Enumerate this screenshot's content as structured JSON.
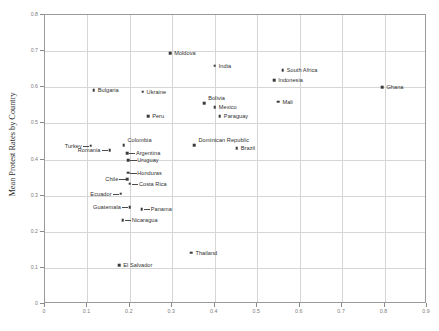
{
  "chart_data": {
    "type": "scatter",
    "title": "",
    "xlabel": "",
    "ylabel": "Mean Protest Rates by Country",
    "xlim": [
      0,
      0.9
    ],
    "ylim": [
      0,
      0.8
    ],
    "xticks": [
      "0",
      "0.1",
      "0.2",
      "0.3",
      "0.4",
      "0.5",
      "0.6",
      "0.7",
      "0.8",
      "0.9"
    ],
    "xtickvals": [
      0,
      0.1,
      0.2,
      0.3,
      0.4,
      0.5,
      0.6,
      0.7,
      0.8,
      0.9
    ],
    "yticks": [
      "0",
      "0.1",
      "0.2",
      "0.3",
      "0.4",
      "0.5",
      "0.6",
      "0.7",
      "0.8"
    ],
    "ytickvals": [
      0,
      0.1,
      0.2,
      0.3,
      0.4,
      0.5,
      0.6,
      0.7,
      0.8
    ],
    "grid": true,
    "legend": "none",
    "marker_color": "#3a3a3a",
    "grid_color": "#d6d6d6",
    "axis_color": "#9a9a9a",
    "points": [
      {
        "label": "Moldova",
        "x": 0.295,
        "y": 0.695,
        "side": "r"
      },
      {
        "label": "India",
        "x": 0.4,
        "y": 0.66,
        "side": "r"
      },
      {
        "label": "South Africa",
        "x": 0.56,
        "y": 0.648,
        "side": "r"
      },
      {
        "label": "Indonesia",
        "x": 0.54,
        "y": 0.62,
        "side": "r"
      },
      {
        "label": "Bulgaria",
        "x": 0.115,
        "y": 0.592,
        "side": "r"
      },
      {
        "label": "Ukraine",
        "x": 0.23,
        "y": 0.588,
        "side": "r"
      },
      {
        "label": "Ghana",
        "x": 0.795,
        "y": 0.6,
        "side": "r"
      },
      {
        "label": "Bolivia",
        "x": 0.375,
        "y": 0.556,
        "side": "r",
        "above": true
      },
      {
        "label": "Mexico",
        "x": 0.4,
        "y": 0.545,
        "side": "r"
      },
      {
        "label": "Mali",
        "x": 0.55,
        "y": 0.56,
        "side": "r"
      },
      {
        "label": "Paraguay",
        "x": 0.412,
        "y": 0.52,
        "side": "r"
      },
      {
        "label": "Peru",
        "x": 0.243,
        "y": 0.52,
        "side": "r"
      },
      {
        "label": "Dominican Republic",
        "x": 0.352,
        "y": 0.44,
        "side": "r",
        "above": true
      },
      {
        "label": "Brazil",
        "x": 0.452,
        "y": 0.432,
        "side": "r"
      },
      {
        "label": "Turkey",
        "x": 0.108,
        "y": 0.438,
        "side": "l",
        "leader": true
      },
      {
        "label": "Colombia",
        "x": 0.185,
        "y": 0.44,
        "side": "r",
        "above": true
      },
      {
        "label": "Romania",
        "x": 0.152,
        "y": 0.425,
        "side": "l",
        "leader": true
      },
      {
        "label": "Argentina",
        "x": 0.193,
        "y": 0.418,
        "side": "r",
        "leader": true
      },
      {
        "label": "Uruguay",
        "x": 0.196,
        "y": 0.398,
        "side": "r",
        "leader": true
      },
      {
        "label": "Honduras",
        "x": 0.196,
        "y": 0.363,
        "side": "r",
        "leader": true
      },
      {
        "label": "Chile",
        "x": 0.194,
        "y": 0.345,
        "side": "l",
        "leader": true
      },
      {
        "label": "Costa Rica",
        "x": 0.2,
        "y": 0.333,
        "side": "r",
        "leader": true
      },
      {
        "label": "Ecuador",
        "x": 0.178,
        "y": 0.305,
        "side": "l",
        "leader": true
      },
      {
        "label": "Guatemala",
        "x": 0.2,
        "y": 0.268,
        "side": "l",
        "leader": true
      },
      {
        "label": "Panama",
        "x": 0.228,
        "y": 0.262,
        "side": "r",
        "leader": true
      },
      {
        "label": "Nicaragua",
        "x": 0.183,
        "y": 0.232,
        "side": "r",
        "leader": true
      },
      {
        "label": "Thailand",
        "x": 0.345,
        "y": 0.142,
        "side": "r"
      },
      {
        "label": "El Salvador",
        "x": 0.175,
        "y": 0.107,
        "side": "r"
      }
    ]
  }
}
